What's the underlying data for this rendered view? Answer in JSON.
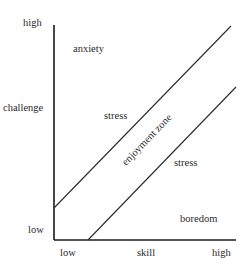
{
  "diagram": {
    "type": "flow-channel",
    "y_axis": {
      "label": "challenge",
      "high": "high",
      "low": "low"
    },
    "x_axis": {
      "label": "skill",
      "low": "low",
      "high": "high"
    },
    "regions": {
      "top_left": "anxiety",
      "upper_stress": "stress",
      "zone": "enjoyment zone",
      "lower_stress": "stress",
      "bottom_right": "boredom"
    }
  }
}
